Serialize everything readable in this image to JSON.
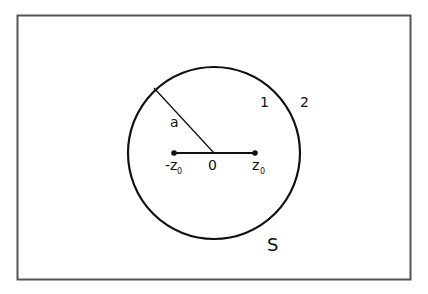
{
  "diagram": {
    "labels": {
      "radius": "a",
      "region_inside": "1",
      "region_outside": "2",
      "origin": "0",
      "neg_point": "-z",
      "neg_point_sub": "0",
      "pos_point": "z",
      "pos_point_sub": "0",
      "surface": "S"
    },
    "colors": {
      "stroke": "#111111",
      "frame": "#555555",
      "background": "#ffffff"
    }
  }
}
